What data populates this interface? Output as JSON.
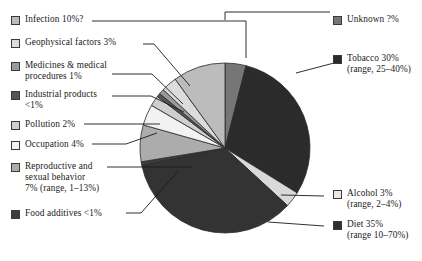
{
  "chart_data": {
    "type": "pie",
    "title": "",
    "subtitle": "",
    "xlabel": "",
    "ylabel": "",
    "legend_position": "left-and-right",
    "grid": false,
    "categories": [
      "Unknown",
      "Tobacco",
      "Alcohol",
      "Diet",
      "Food additives",
      "Reproductive and sexual behavior",
      "Occupation",
      "Pollution",
      "Industrial products",
      "Medicines & medical procedures",
      "Geophysical factors",
      "Infection"
    ],
    "values": [
      4,
      30,
      3,
      35,
      0.7,
      7,
      4,
      2,
      0.7,
      1,
      3,
      10
    ],
    "labels": [
      "Unknown ?%",
      "Tobacco 30% (range, 25–40%)",
      "Alcohol 3% (range, 2–4%)",
      "Diet 35% (range 10–70%)",
      "Food additives <1%",
      "Reproductive and sexual behavior 7% (range, 1–13%)",
      "Occupation 4%",
      "Pollution 2%",
      "Industrial products <1%",
      "Medicines & medical procedures 1%",
      "Geophysical factors 3%",
      "Infection 10%?"
    ],
    "colors": [
      "#767676",
      "#2b2b2b",
      "#d9d9d9",
      "#333333",
      "#3d3d3d",
      "#acacac",
      "#f2f2f2",
      "#cfcfcf",
      "#555555",
      "#9a9a9a",
      "#dcdcdc",
      "#bcbcbc"
    ]
  },
  "legend_left": [
    {
      "name": "infection",
      "line1": "Infection 10%?",
      "line2": "",
      "color": "#bcbcbc"
    },
    {
      "name": "geophysical-factors",
      "line1": "Geophysical factors 3%",
      "line2": "",
      "color": "#dcdcdc"
    },
    {
      "name": "medicines-medical-procedures",
      "line1": "Medicines & medical",
      "line2": "procedures 1%",
      "color": "#9a9a9a"
    },
    {
      "name": "industrial-products",
      "line1": "Industrial products",
      "line2": "<1%",
      "color": "#555555"
    },
    {
      "name": "pollution",
      "line1": "Pollution 2%",
      "line2": "",
      "color": "#cfcfcf"
    },
    {
      "name": "occupation",
      "line1": "Occupation 4%",
      "line2": "",
      "color": "#f2f2f2"
    },
    {
      "name": "reproductive-sexual-behavior",
      "line1": "Reproductive and",
      "line2": "sexual behavior",
      "line3": "7% (range, 1–13%)",
      "color": "#acacac"
    },
    {
      "name": "food-additives",
      "line1": "Food additives <1%",
      "line2": "",
      "color": "#3d3d3d"
    }
  ],
  "legend_right": [
    {
      "name": "unknown",
      "line1": "Unknown ?%",
      "line2": "",
      "color": "#767676"
    },
    {
      "name": "tobacco",
      "line1": "Tobacco 30%",
      "line2": "(range, 25–40%)",
      "color": "#2b2b2b"
    },
    {
      "name": "alcohol",
      "line1": "Alcohol 3%",
      "line2": "(range, 2–4%)",
      "color": "#e8e8e8"
    },
    {
      "name": "diet",
      "line1": "Diet 35%",
      "line2": "(range 10–70%)",
      "color": "#2f2f2f"
    }
  ]
}
